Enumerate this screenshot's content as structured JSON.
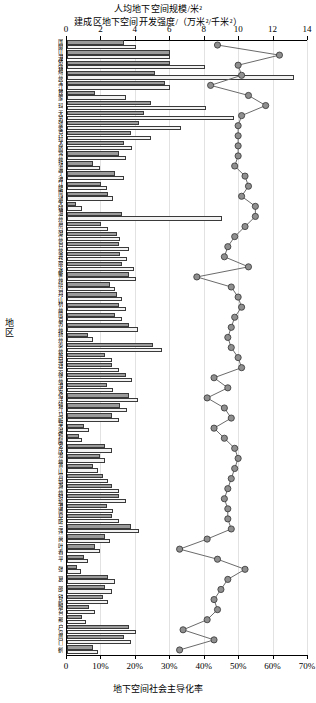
{
  "chart": {
    "title_top_line1": "人均地下空间规模/米²",
    "title_top_line2": "建成区地下空间开发强度/（万米²/千米²）",
    "xlabel_bottom": "地下空间社会主导化率",
    "ylabel": "地区",
    "top_ticks": [
      "0",
      "2",
      "4",
      "6",
      "8",
      "10",
      "12",
      "14"
    ],
    "bottom_ticks": [
      "0",
      "10%",
      "20%",
      "30%",
      "40%",
      "50%",
      "60%",
      "70%"
    ],
    "marker_color": "#8f8f8f",
    "marker_edge": "#333333",
    "bar_a_color": "#9a9a9a",
    "bar_b_color": "#f2f2f2"
  },
  "chart_data": {
    "type": "bar",
    "orientation": "horizontal",
    "xlabel": "地下空间社会主导化率",
    "ylabel": "地区",
    "xlim_top": [
      0,
      14
    ],
    "xlim_bottom": [
      0,
      0.7
    ],
    "grid": true,
    "legend_position": "none",
    "categories": [
      "国网",
      "山港",
      "依锡",
      "绵州",
      "全江",
      "昆家",
      "玛",
      "无苏",
      "张家",
      "克拉",
      "太原",
      "常州",
      "珠海",
      "宁波",
      "江阴",
      "南通",
      "无锡",
      "温州",
      "嘉兴",
      "湖州",
      "台州",
      "金华",
      "丽水",
      "衢州",
      "绍兴",
      "舟山",
      "杭州",
      "南京",
      "苏州",
      "扬州",
      "泰州",
      "盐城",
      "连云",
      "徐州",
      "淮安",
      "宿迁",
      "镇江",
      "马鞍",
      "芜湖",
      "铜陵",
      "安庆",
      "池州",
      "黄山",
      "宣城",
      "滁州",
      "蚌埠",
      "淮南",
      "阜阳",
      "三连",
      "尚",
      "叶春",
      "平",
      "张",
      "葛",
      "邵",
      "铁岭",
      "烟台",
      "那",
      "户岛",
      "周口",
      "鹤"
    ],
    "series": [
      {
        "name": "人均地下空间规模/米²",
        "unit": "米²",
        "axis": "top",
        "values": [
          3.3,
          6.0,
          6.0,
          5.1,
          5.7,
          1.6,
          4.9,
          4.5,
          4.2,
          3.7,
          3.3,
          3.0,
          1.5,
          2.8,
          2.0,
          2.4,
          0.5,
          3.2,
          2.0,
          2.9,
          3.0,
          3.1,
          3.2,
          3.6,
          2.5,
          2.9,
          3.0,
          2.8,
          3.6,
          1.2,
          5.0,
          2.2,
          2.6,
          3.4,
          2.3,
          3.6,
          3.1,
          2.6,
          1.0,
          0.7,
          2.2,
          1.9,
          1.5,
          2.1,
          2.6,
          3.0,
          2.3,
          2.6,
          3.7,
          2.2,
          1.6,
          1.0,
          0.6,
          2.4,
          2.2,
          2.1,
          1.3,
          0.9,
          3.6,
          3.3,
          1.5
        ]
      },
      {
        "name": "建成区地下空间开发强度/（万米²/千米²）",
        "unit": "万米²/千米²",
        "axis": "top",
        "values": [
          4.0,
          6.0,
          8.0,
          13.2,
          6.0,
          3.4,
          8.1,
          9.7,
          6.6,
          4.9,
          3.8,
          3.4,
          1.9,
          3.3,
          2.3,
          2.7,
          0.9,
          9.0,
          2.4,
          3.1,
          3.6,
          3.5,
          3.9,
          4.0,
          2.8,
          3.2,
          3.4,
          3.2,
          4.1,
          1.5,
          5.5,
          2.6,
          3.0,
          3.8,
          2.7,
          4.1,
          3.5,
          3.0,
          1.3,
          0.9,
          2.6,
          2.2,
          1.8,
          2.4,
          3.0,
          3.4,
          2.7,
          3.0,
          4.2,
          2.5,
          1.9,
          1.2,
          0.8,
          2.8,
          2.6,
          2.4,
          1.6,
          1.1,
          4.0,
          3.7,
          1.8
        ]
      },
      {
        "name": "地下空间社会主导化率",
        "unit": "%",
        "axis": "bottom",
        "marker": "circle",
        "values": [
          0.44,
          0.62,
          0.5,
          0.51,
          0.42,
          0.53,
          0.58,
          0.51,
          0.5,
          0.5,
          0.5,
          0.5,
          0.49,
          0.52,
          0.53,
          0.51,
          0.55,
          0.55,
          0.52,
          0.49,
          0.47,
          0.46,
          0.53,
          0.38,
          0.48,
          0.5,
          0.51,
          0.49,
          0.48,
          0.47,
          0.48,
          0.5,
          0.51,
          0.43,
          0.47,
          0.41,
          0.46,
          0.48,
          0.43,
          0.46,
          0.49,
          0.5,
          0.49,
          0.48,
          0.47,
          0.46,
          0.47,
          0.47,
          0.48,
          0.41,
          0.33,
          0.44,
          0.52,
          0.47,
          0.45,
          0.43,
          0.44,
          0.41,
          0.34,
          0.43,
          0.33
        ]
      }
    ]
  }
}
